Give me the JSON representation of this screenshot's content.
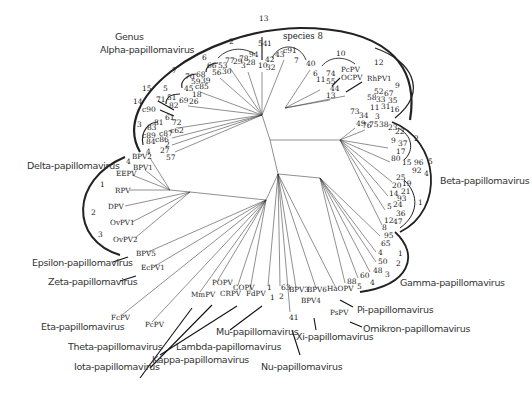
{
  "diagram": {
    "type": "unrooted phylogenetic tree",
    "header": {
      "line1": "Genus",
      "line2": "Alpha-papillomavirus",
      "species_label": "species 8"
    },
    "genera": [
      {
        "id": "alpha",
        "label": "Alpha-papillomavirus"
      },
      {
        "id": "beta",
        "label": "Beta-papillomavirus"
      },
      {
        "id": "gamma",
        "label": "Gamma-papillomavirus"
      },
      {
        "id": "delta",
        "label": "Delta-papillomavirus"
      },
      {
        "id": "epsilon",
        "label": "Epsilon-papillomavirus"
      },
      {
        "id": "zeta",
        "label": "Zeta-papillomavirus"
      },
      {
        "id": "eta",
        "label": "Eta-papillomavirus"
      },
      {
        "id": "theta",
        "label": "Theta-papillomavirus"
      },
      {
        "id": "iota",
        "label": "Iota-papillomavirus"
      },
      {
        "id": "kappa",
        "label": "Kappa-papillomavirus"
      },
      {
        "id": "lambda",
        "label": "Lambda-papillomavirus"
      },
      {
        "id": "mu",
        "label": "Mu-papillomavirus"
      },
      {
        "id": "nu",
        "label": "Nu-papillomavirus"
      },
      {
        "id": "xi",
        "label": "Xi-papillomavirus"
      },
      {
        "id": "pi",
        "label": "Pi-papillomavirus"
      },
      {
        "id": "omikron",
        "label": "Omikron-papillomavirus"
      }
    ],
    "leaves": [
      {
        "t": "13",
        "x": 259,
        "y": 21
      },
      {
        "t": "54",
        "x": 258,
        "y": 46
      },
      {
        "t": "1",
        "x": 267,
        "y": 46
      },
      {
        "t": "43",
        "x": 275,
        "y": 57
      },
      {
        "t": "c91",
        "x": 283,
        "y": 53
      },
      {
        "t": "10",
        "x": 258,
        "y": 68
      },
      {
        "t": "42",
        "x": 265,
        "y": 62
      },
      {
        "t": "32",
        "x": 266,
        "y": 70
      },
      {
        "t": "2",
        "x": 229,
        "y": 44
      },
      {
        "t": "77",
        "x": 225,
        "y": 63
      },
      {
        "t": "29",
        "x": 233,
        "y": 64
      },
      {
        "t": "3",
        "x": 241,
        "y": 68
      },
      {
        "t": "78",
        "x": 239,
        "y": 61
      },
      {
        "t": "94",
        "x": 249,
        "y": 57
      },
      {
        "t": "28",
        "x": 246,
        "y": 65
      },
      {
        "t": "6",
        "x": 202,
        "y": 60
      },
      {
        "t": "66",
        "x": 207,
        "y": 68
      },
      {
        "t": "53",
        "x": 218,
        "y": 68
      },
      {
        "t": "56",
        "x": 212,
        "y": 75
      },
      {
        "t": "30",
        "x": 222,
        "y": 74
      },
      {
        "t": "7",
        "x": 172,
        "y": 73
      },
      {
        "t": "70",
        "x": 185,
        "y": 79
      },
      {
        "t": "68",
        "x": 196,
        "y": 77
      },
      {
        "t": "59",
        "x": 191,
        "y": 84
      },
      {
        "t": "39",
        "x": 201,
        "y": 83
      },
      {
        "t": "45",
        "x": 184,
        "y": 91
      },
      {
        "t": "c85",
        "x": 195,
        "y": 89
      },
      {
        "t": "18",
        "x": 192,
        "y": 97
      },
      {
        "t": "26",
        "x": 189,
        "y": 104
      },
      {
        "t": "5",
        "x": 163,
        "y": 91
      },
      {
        "t": "51",
        "x": 167,
        "y": 100
      },
      {
        "t": "69",
        "x": 179,
        "y": 103
      },
      {
        "t": "82",
        "x": 169,
        "y": 108
      },
      {
        "t": "15",
        "x": 142,
        "y": 91
      },
      {
        "t": "71",
        "x": 156,
        "y": 102
      },
      {
        "t": "14",
        "x": 133,
        "y": 104
      },
      {
        "t": "c90",
        "x": 142,
        "y": 112
      },
      {
        "t": "61",
        "x": 165,
        "y": 120
      },
      {
        "t": "81",
        "x": 154,
        "y": 125
      },
      {
        "t": "72",
        "x": 172,
        "y": 125
      },
      {
        "t": "83",
        "x": 147,
        "y": 130
      },
      {
        "t": "c62",
        "x": 170,
        "y": 133
      },
      {
        "t": "3",
        "x": 137,
        "y": 127
      },
      {
        "t": "c89",
        "x": 142,
        "y": 138
      },
      {
        "t": "c87",
        "x": 159,
        "y": 136
      },
      {
        "t": "c86",
        "x": 155,
        "y": 142
      },
      {
        "t": "84",
        "x": 146,
        "y": 144
      },
      {
        "t": "2",
        "x": 165,
        "y": 147
      },
      {
        "t": "4",
        "x": 146,
        "y": 154
      },
      {
        "t": "27",
        "x": 160,
        "y": 153
      },
      {
        "t": "57",
        "x": 166,
        "y": 160
      },
      {
        "t": "7",
        "x": 294,
        "y": 63
      },
      {
        "t": "40",
        "x": 306,
        "y": 66
      },
      {
        "t": "6",
        "x": 313,
        "y": 76
      },
      {
        "t": "11",
        "x": 316,
        "y": 82
      },
      {
        "t": "74",
        "x": 326,
        "y": 76
      },
      {
        "t": "55",
        "x": 326,
        "y": 84
      },
      {
        "t": "44",
        "x": 330,
        "y": 91
      },
      {
        "t": "13",
        "x": 326,
        "y": 98
      },
      {
        "t": "10",
        "x": 336,
        "y": 56
      },
      {
        "t": "PcPV",
        "x": 341,
        "y": 72
      },
      {
        "t": "OCPV",
        "x": 341,
        "y": 80
      },
      {
        "t": "12",
        "x": 374,
        "y": 65
      },
      {
        "t": "RhPV1",
        "x": 367,
        "y": 81
      },
      {
        "t": "9",
        "x": 395,
        "y": 88
      },
      {
        "t": "52",
        "x": 374,
        "y": 94
      },
      {
        "t": "67",
        "x": 384,
        "y": 96
      },
      {
        "t": "58",
        "x": 367,
        "y": 100
      },
      {
        "t": "33",
        "x": 376,
        "y": 102
      },
      {
        "t": "35",
        "x": 388,
        "y": 103
      },
      {
        "t": "11",
        "x": 370,
        "y": 110
      },
      {
        "t": "31",
        "x": 381,
        "y": 109
      },
      {
        "t": "16",
        "x": 390,
        "y": 112
      },
      {
        "t": "73",
        "x": 350,
        "y": 114
      },
      {
        "t": "34",
        "x": 359,
        "y": 118
      },
      {
        "t": "3",
        "x": 375,
        "y": 119
      },
      {
        "t": "49",
        "x": 356,
        "y": 126
      },
      {
        "t": "76",
        "x": 362,
        "y": 128
      },
      {
        "t": "75",
        "x": 369,
        "y": 127
      },
      {
        "t": "38",
        "x": 379,
        "y": 127
      },
      {
        "t": "23",
        "x": 388,
        "y": 130
      },
      {
        "t": "22",
        "x": 395,
        "y": 134
      },
      {
        "t": "2",
        "x": 414,
        "y": 141
      },
      {
        "t": "9",
        "x": 391,
        "y": 143
      },
      {
        "t": "37",
        "x": 398,
        "y": 146
      },
      {
        "t": "17",
        "x": 396,
        "y": 154
      },
      {
        "t": "80",
        "x": 391,
        "y": 161
      },
      {
        "t": "15",
        "x": 402,
        "y": 165
      },
      {
        "t": "96",
        "x": 414,
        "y": 165
      },
      {
        "t": "5",
        "x": 428,
        "y": 164
      },
      {
        "t": "92",
        "x": 412,
        "y": 173
      },
      {
        "t": "4",
        "x": 424,
        "y": 176
      },
      {
        "t": "25",
        "x": 396,
        "y": 180
      },
      {
        "t": "20",
        "x": 392,
        "y": 188
      },
      {
        "t": "19",
        "x": 402,
        "y": 186
      },
      {
        "t": "21",
        "x": 401,
        "y": 194
      },
      {
        "t": "14",
        "x": 389,
        "y": 196
      },
      {
        "t": "93",
        "x": 397,
        "y": 201
      },
      {
        "t": "1",
        "x": 418,
        "y": 205
      },
      {
        "t": "5",
        "x": 387,
        "y": 209
      },
      {
        "t": "24",
        "x": 393,
        "y": 207
      },
      {
        "t": "36",
        "x": 396,
        "y": 216
      },
      {
        "t": "12",
        "x": 384,
        "y": 223
      },
      {
        "t": "47",
        "x": 393,
        "y": 224
      },
      {
        "t": "8",
        "x": 382,
        "y": 230
      },
      {
        "t": "95",
        "x": 384,
        "y": 238
      },
      {
        "t": "65",
        "x": 381,
        "y": 246
      },
      {
        "t": "4",
        "x": 378,
        "y": 255
      },
      {
        "t": "1",
        "x": 398,
        "y": 256
      },
      {
        "t": "50",
        "x": 378,
        "y": 264
      },
      {
        "t": "2",
        "x": 396,
        "y": 266
      },
      {
        "t": "48",
        "x": 373,
        "y": 273
      },
      {
        "t": "3",
        "x": 385,
        "y": 277
      },
      {
        "t": "60",
        "x": 360,
        "y": 278
      },
      {
        "t": "4",
        "x": 370,
        "y": 285
      },
      {
        "t": "88",
        "x": 347,
        "y": 284
      },
      {
        "t": "5",
        "x": 357,
        "y": 289
      },
      {
        "t": "BPV2",
        "x": 132,
        "y": 159
      },
      {
        "t": "4",
        "x": 126,
        "y": 164
      },
      {
        "t": "BPV1",
        "x": 133,
        "y": 170
      },
      {
        "t": "EEPV",
        "x": 116,
        "y": 176
      },
      {
        "t": "1",
        "x": 100,
        "y": 187
      },
      {
        "t": "RPV",
        "x": 115,
        "y": 193
      },
      {
        "t": "DPV",
        "x": 108,
        "y": 209
      },
      {
        "t": "2",
        "x": 91,
        "y": 215
      },
      {
        "t": "OvPV1",
        "x": 110,
        "y": 225
      },
      {
        "t": "3",
        "x": 98,
        "y": 237
      },
      {
        "t": "OvPV2",
        "x": 113,
        "y": 242
      },
      {
        "t": "BPV5",
        "x": 136,
        "y": 256
      },
      {
        "t": "EcPV1",
        "x": 141,
        "y": 270
      },
      {
        "t": "FcPV",
        "x": 111,
        "y": 320
      },
      {
        "t": "PcPV",
        "x": 145,
        "y": 327
      },
      {
        "t": "MmPV",
        "x": 191,
        "y": 297
      },
      {
        "t": "POPV",
        "x": 212,
        "y": 285
      },
      {
        "t": "CRPV",
        "x": 220,
        "y": 296
      },
      {
        "t": "COPV",
        "x": 233,
        "y": 290
      },
      {
        "t": "FdPV",
        "x": 246,
        "y": 296
      },
      {
        "t": "1",
        "x": 267,
        "y": 290
      },
      {
        "t": "63",
        "x": 281,
        "y": 290
      },
      {
        "t": "1",
        "x": 270,
        "y": 300
      },
      {
        "t": "2",
        "x": 279,
        "y": 299
      },
      {
        "t": "BPV3",
        "x": 289,
        "y": 292
      },
      {
        "t": "BPV6",
        "x": 307,
        "y": 292
      },
      {
        "t": "HaOPV",
        "x": 327,
        "y": 291
      },
      {
        "t": "BPV4",
        "x": 301,
        "y": 303
      },
      {
        "t": "41",
        "x": 289,
        "y": 320
      },
      {
        "t": "PsPV",
        "x": 330,
        "y": 315
      }
    ]
  }
}
